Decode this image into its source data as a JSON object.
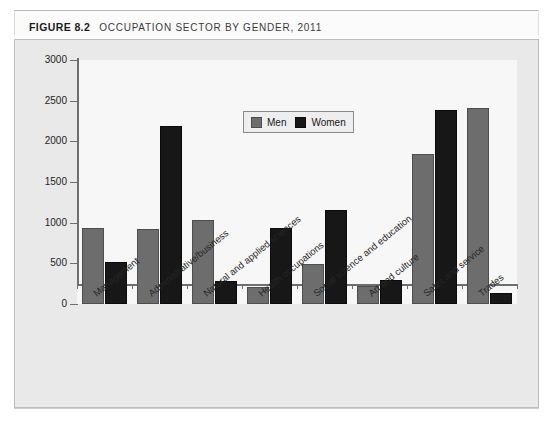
{
  "header": {
    "figure_number": "FIGURE 8.2",
    "title": "OCCUPATION SECTOR BY GENDER, 2011"
  },
  "legend": {
    "position": "inside-top-center",
    "items": [
      {
        "label": "Men",
        "color": "#6d6d6d"
      },
      {
        "label": "Women",
        "color": "#171717"
      }
    ]
  },
  "chart_data": {
    "type": "bar",
    "title": "OCCUPATION SECTOR BY GENDER, 2011",
    "xlabel": "",
    "ylabel": "",
    "ylim": [
      0,
      3000
    ],
    "yticks": [
      0,
      500,
      1000,
      1500,
      2000,
      2500,
      3000
    ],
    "ytick_labels": [
      "0",
      "500",
      "1000",
      "1500",
      "2000",
      "2500",
      "3000"
    ],
    "grid": false,
    "categories": [
      "Management",
      "Administrative/business",
      "Natural and applied sciences",
      "Health occupations",
      "Social science and education",
      "Art and culture",
      "Sales and service",
      "Trades"
    ],
    "series": [
      {
        "name": "Men",
        "color": "#6d6d6d",
        "values": [
          930,
          920,
          1030,
          215,
          490,
          225,
          1850,
          2415
        ]
      },
      {
        "name": "Women",
        "color": "#171717",
        "values": [
          520,
          2190,
          280,
          940,
          1155,
          290,
          2390,
          135
        ]
      }
    ]
  },
  "footer": {
    "note": ""
  }
}
